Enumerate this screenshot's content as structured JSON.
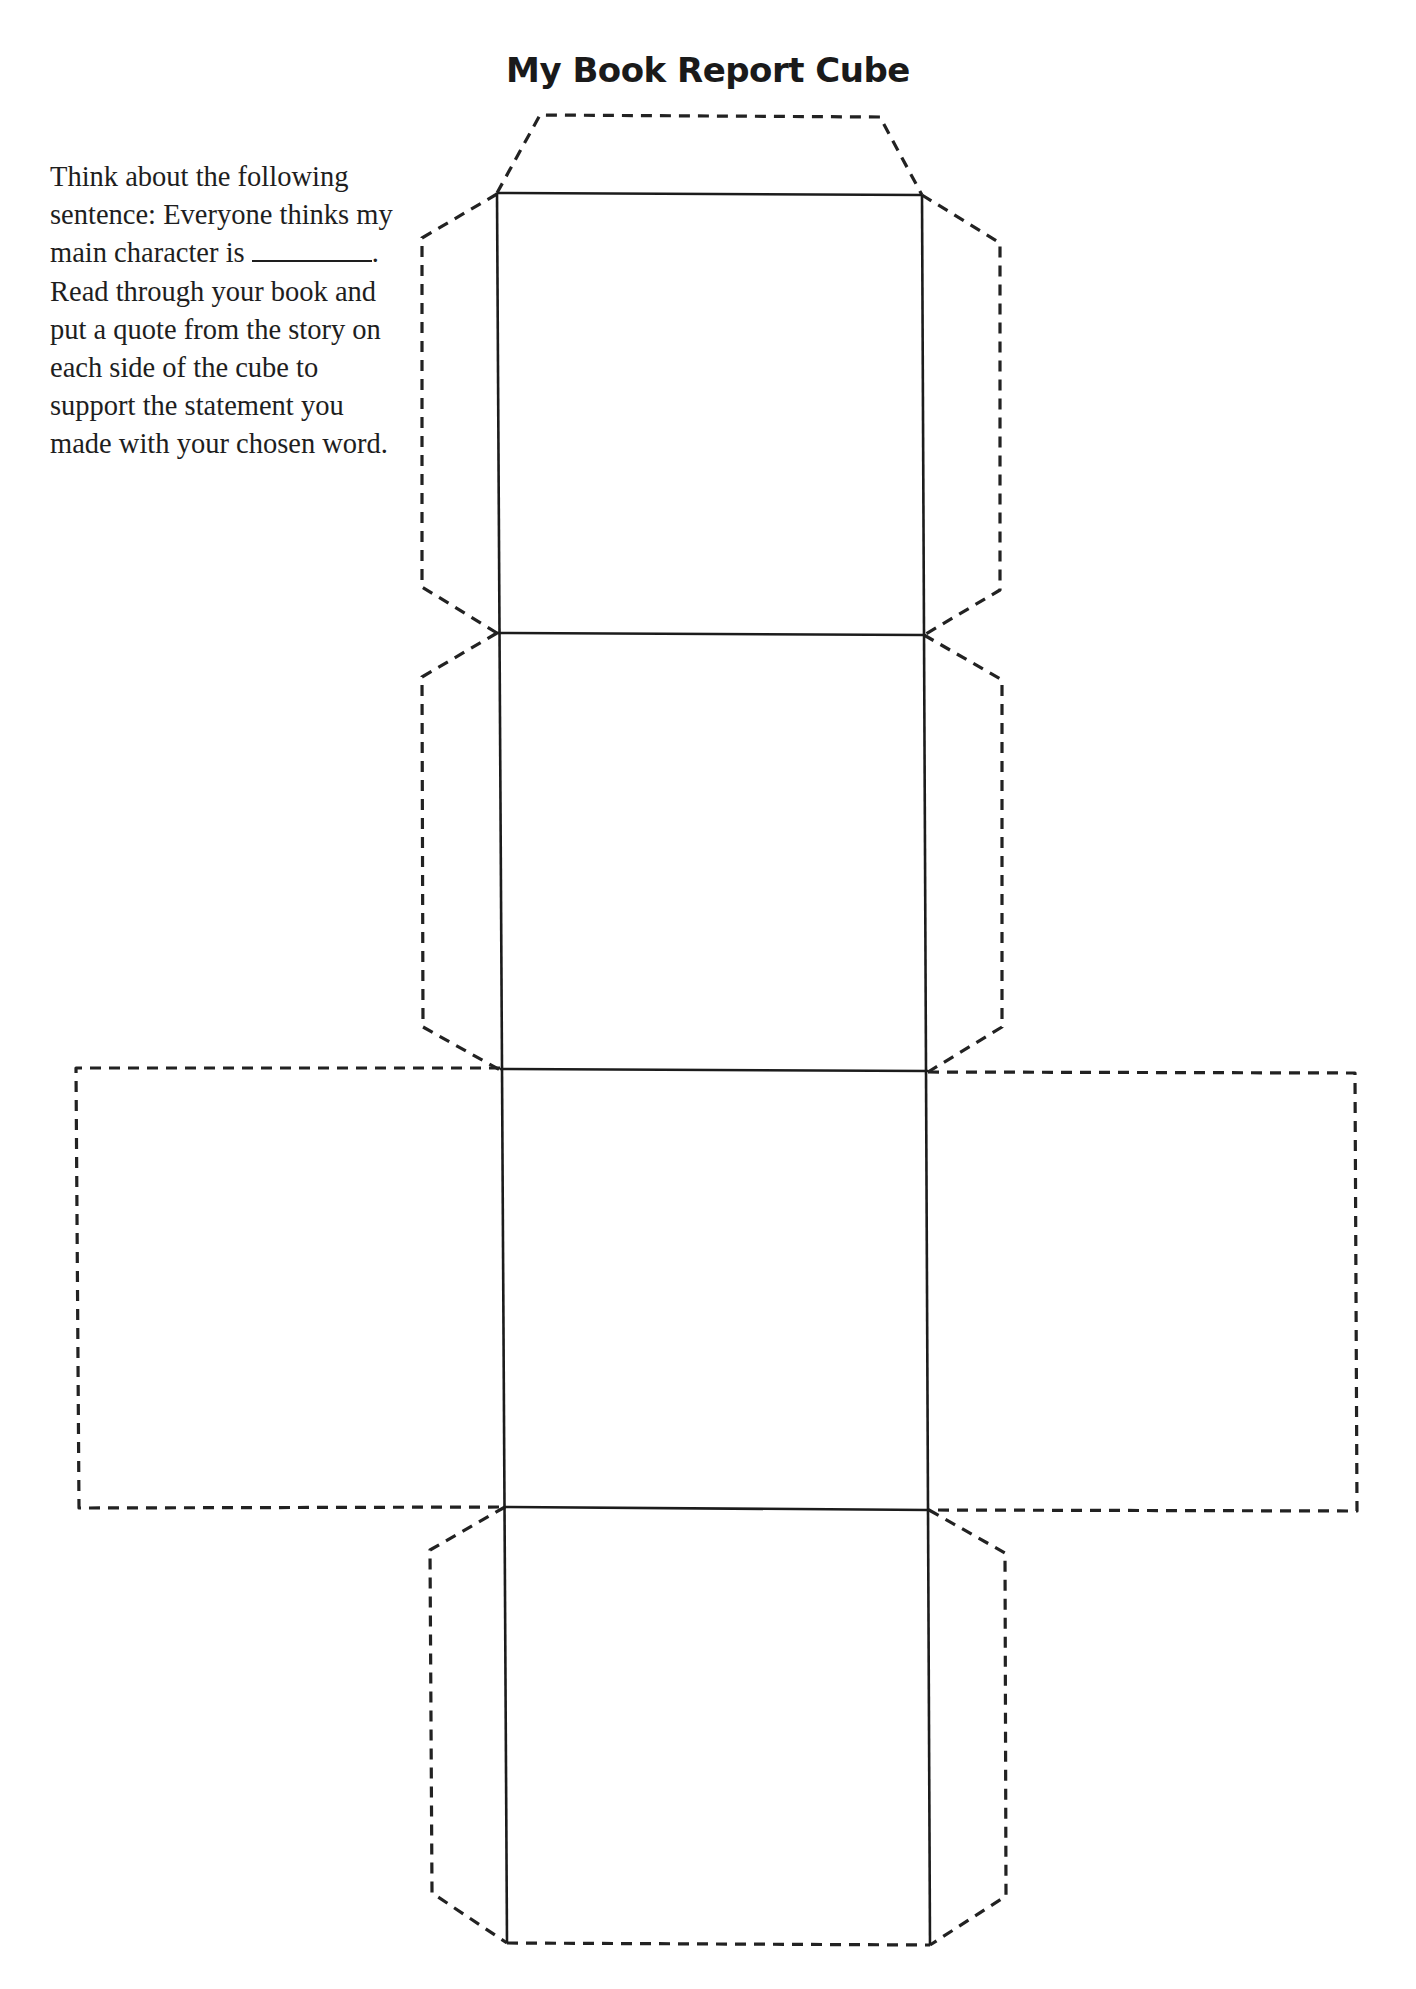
{
  "page": {
    "title": "My Book Report Cube",
    "instructions": {
      "before_blank": "Think about the following sentence: Everyone thinks my main character is ",
      "blank": "________",
      "after_blank": ". Read through your book and put a quote from the story on each side of the cube to support the statement you made with your chosen word."
    }
  },
  "cube_net": {
    "faces": [
      {
        "id": "face-1",
        "label": ""
      },
      {
        "id": "face-2",
        "label": ""
      },
      {
        "id": "face-3",
        "label": ""
      },
      {
        "id": "face-4",
        "label": ""
      },
      {
        "id": "face-left-wing",
        "label": ""
      },
      {
        "id": "face-right-wing",
        "label": ""
      }
    ],
    "line_styles": {
      "fold_line": "solid",
      "cut_line": "dashed"
    },
    "colors": {
      "line": "#222222",
      "background": "#ffffff"
    }
  }
}
